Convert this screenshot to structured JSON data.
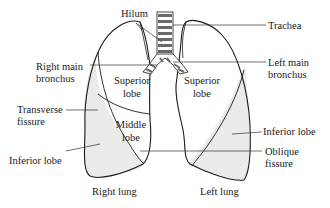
{
  "diagram": {
    "colors": {
      "line": "#1a1a1a",
      "shade": "#e6e6e6",
      "background": "#ffffff"
    },
    "labels": {
      "hilum": "Hilum",
      "trachea": "Trachea",
      "right_main_bronchus_1": "Right main",
      "right_main_bronchus_2": "bronchus",
      "left_main_bronchus_1": "Left main",
      "left_main_bronchus_2": "bronchus",
      "right_superior_1": "Superior",
      "right_superior_2": "lobe",
      "left_superior_1": "Superior",
      "left_superior_2": "lobe",
      "transverse_fissure_1": "Transverse",
      "transverse_fissure_2": "fissure",
      "middle_lobe_1": "Middle",
      "middle_lobe_2": "lobe",
      "right_inferior": "Inferior lobe",
      "left_inferior": "Inferior lobe",
      "oblique_fissure_1": "Oblique",
      "oblique_fissure_2": "fissure",
      "right_lung": "Right lung",
      "left_lung": "Left lung"
    }
  }
}
